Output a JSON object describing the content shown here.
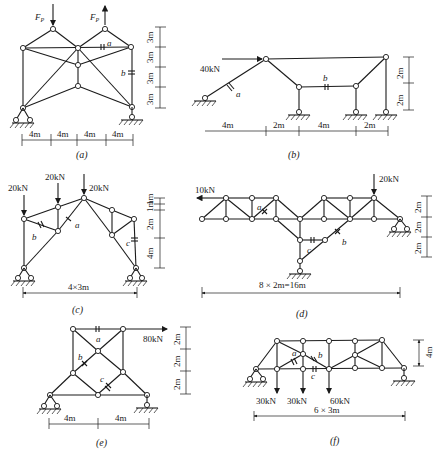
{
  "figures": [
    {
      "caption": "(a)",
      "loads": [
        {
          "label": "F",
          "sub": "P",
          "dir": "down"
        },
        {
          "label": "F",
          "sub": "P",
          "dir": "up"
        }
      ],
      "members": [
        "a",
        "b"
      ],
      "dims_horizontal": [
        "4m",
        "4m",
        "4m",
        "4m"
      ],
      "dims_vertical": [
        "3m",
        "3m",
        "3m",
        "3m"
      ]
    },
    {
      "caption": "(b)",
      "loads": [
        {
          "label": "40kN",
          "dir": "right"
        }
      ],
      "members": [
        "a",
        "b"
      ],
      "dims_horizontal": [
        "4m",
        "2m",
        "4m",
        "2m"
      ],
      "dims_vertical": [
        "2m",
        "2m"
      ]
    },
    {
      "caption": "(c)",
      "loads": [
        {
          "label": "20kN",
          "dir": "down"
        },
        {
          "label": "20kN",
          "dir": "down"
        },
        {
          "label": "20kN",
          "dir": "down"
        }
      ],
      "members": [
        "a",
        "b",
        "c"
      ],
      "dims_horizontal": [
        "4×3m"
      ],
      "dims_vertical": [
        "1m",
        "1m",
        "2m",
        "4m"
      ]
    },
    {
      "caption": "(d)",
      "loads": [
        {
          "label": "10kN",
          "dir": "left"
        },
        {
          "label": "20kN",
          "dir": "down"
        }
      ],
      "members": [
        "a",
        "b",
        "c"
      ],
      "dims_horizontal": [
        "8 × 2m=16m"
      ],
      "dims_vertical": [
        "2m",
        "2m",
        "2m"
      ]
    },
    {
      "caption": "(e)",
      "loads": [
        {
          "label": "80kN",
          "dir": "right"
        }
      ],
      "members": [
        "a",
        "b",
        "c"
      ],
      "dims_horizontal": [
        "4m",
        "4m"
      ],
      "dims_vertical": [
        "2m",
        "2m",
        "2m"
      ]
    },
    {
      "caption": "(f)",
      "loads": [
        {
          "label": "30kN",
          "dir": "down"
        },
        {
          "label": "30kN",
          "dir": "down"
        },
        {
          "label": "60kN",
          "dir": "down"
        }
      ],
      "members": [
        "a",
        "b",
        "c"
      ],
      "dims_horizontal": [
        "6 × 3m"
      ],
      "dims_vertical": [
        "4m"
      ]
    }
  ]
}
